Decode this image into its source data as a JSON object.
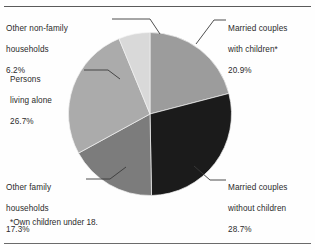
{
  "figure": {
    "footnote": "*Own children under 18.",
    "rules": {
      "top": true,
      "bottom": true
    }
  },
  "chart_data": {
    "type": "pie",
    "title": "",
    "subtitle": "",
    "xlabel": "",
    "ylabel": "",
    "legend_position": "callout-labels",
    "grid": false,
    "start_angle_deg": 0,
    "direction": "clockwise",
    "units": "percent",
    "total": 99.8,
    "categories": [
      "Married couples with children*",
      "Married couples without children",
      "Other family households",
      "Persons living alone",
      "Other non-family households"
    ],
    "values": [
      20.9,
      28.7,
      17.3,
      26.7,
      6.2
    ],
    "labels": [
      "20.9%",
      "28.7%",
      "17.3%",
      "26.7%",
      "6.2%"
    ],
    "colors": [
      "#9c9c9c",
      "#1b1b1b",
      "#7c7c7c",
      "#ababab",
      "#d9d9d9"
    ],
    "slices": [
      {
        "name": "Married couples with children*",
        "value": 20.9,
        "label": "20.9%",
        "color": "#9c9c9c",
        "callout_text": "Married couples\nwith children*",
        "callout_position": "top-right"
      },
      {
        "name": "Married couples without children",
        "value": 28.7,
        "label": "28.7%",
        "color": "#1b1b1b",
        "callout_text": "Married couples\nwithout children",
        "callout_position": "bottom-right"
      },
      {
        "name": "Other family households",
        "value": 17.3,
        "label": "17.3%",
        "color": "#7c7c7c",
        "callout_text": "Other family\nhouseholds",
        "callout_position": "bottom-left"
      },
      {
        "name": "Persons living alone",
        "value": 26.7,
        "label": "26.7%",
        "color": "#ababab",
        "callout_text": "Persons\nliving alone",
        "callout_position": "left"
      },
      {
        "name": "Other non-family households",
        "value": 6.2,
        "label": "6.2%",
        "color": "#d9d9d9",
        "callout_text": "Other non-family\nhouseholds",
        "callout_position": "top-left"
      }
    ]
  },
  "callouts": {
    "nonfamily": {
      "line1": "Other non-family",
      "line2": "households",
      "pct": "6.2%"
    },
    "alone": {
      "line1": "Persons",
      "line2": "living alone",
      "pct": "26.7%"
    },
    "otherfam": {
      "line1": "Other family",
      "line2": "households",
      "pct": "17.3%"
    },
    "withkids": {
      "line1": "Married couples",
      "line2": "with children*",
      "pct": "20.9%"
    },
    "nokids": {
      "line1": "Married couples",
      "line2": "without children",
      "pct": "28.7%"
    }
  }
}
